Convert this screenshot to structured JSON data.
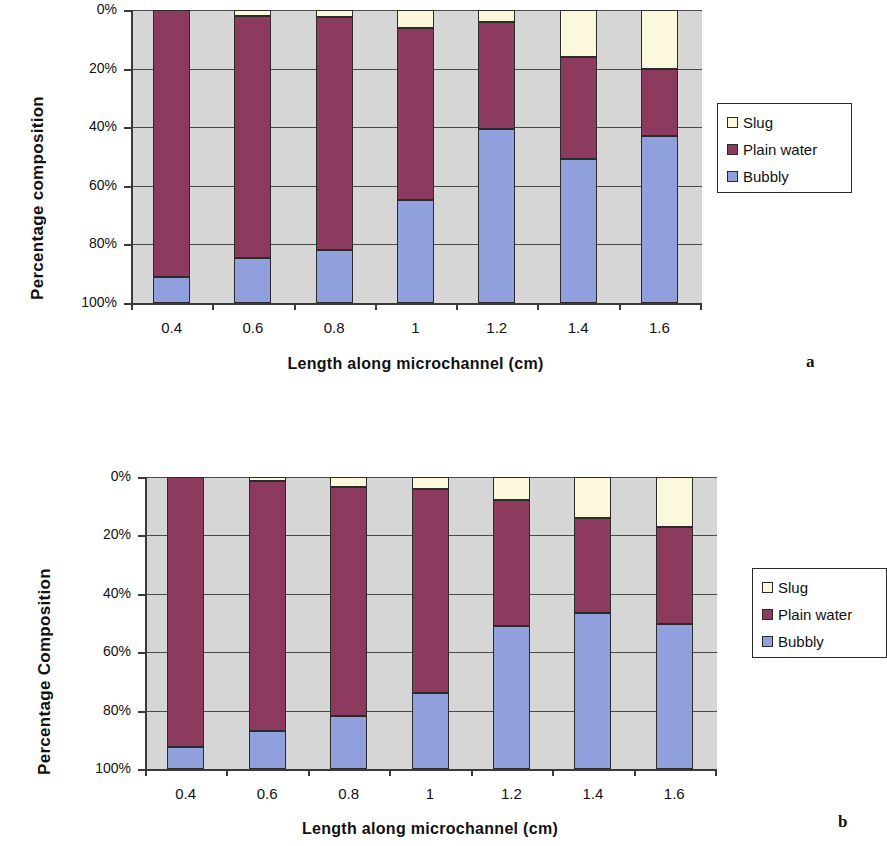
{
  "figure": {
    "background": "#ffffff",
    "series_colors": {
      "slug": "#fbf8dc",
      "plain_water": "#8c3a5e",
      "bubbly": "#8fa0dc",
      "plot_background": "#d6d6d6",
      "axis": "#3a3a3a"
    }
  },
  "charts": [
    {
      "panel": "a",
      "ylabel": "Percentage composition",
      "xlabel": "Length along microchannel (cm)",
      "ytick_labels": [
        "100%",
        "80%",
        "60%",
        "40%",
        "20%",
        "0%"
      ],
      "xtick_labels": [
        "0.4",
        "0.6",
        "0.8",
        "1",
        "1.2",
        "1.4",
        "1.6"
      ],
      "legend": [
        {
          "label": "Slug",
          "color": "#fbf8dc"
        },
        {
          "label": "Plain water",
          "color": "#8c3a5e"
        },
        {
          "label": "Bubbly",
          "color": "#8fa0dc"
        }
      ]
    },
    {
      "panel": "b",
      "ylabel": "Percentage Composition",
      "xlabel": "Length along microchannel (cm)",
      "ytick_labels": [
        "100%",
        "80%",
        "60%",
        "40%",
        "20%",
        "0%"
      ],
      "xtick_labels": [
        "0.4",
        "0.6",
        "0.8",
        "1",
        "1.2",
        "1.4",
        "1.6"
      ],
      "legend": [
        {
          "label": "Slug",
          "color": "#fbf8dc"
        },
        {
          "label": "Plain water",
          "color": "#8c3a5e"
        },
        {
          "label": "Bubbly",
          "color": "#8fa0dc"
        }
      ]
    }
  ],
  "chart_data": [
    {
      "type": "bar",
      "stacked": true,
      "panel": "a",
      "title": "",
      "xlabel": "Length along microchannel (cm)",
      "ylabel": "Percentage composition",
      "categories": [
        "0.4",
        "0.6",
        "0.8",
        "1",
        "1.2",
        "1.4",
        "1.6"
      ],
      "ylim": [
        0,
        100
      ],
      "ytick_values": [
        0,
        20,
        40,
        60,
        80,
        100
      ],
      "grid": true,
      "legend_position": "right",
      "series": [
        {
          "name": "Bubbly",
          "color": "#8fa0dc",
          "values": [
            9,
            15.5,
            18,
            35,
            59.5,
            49,
            57
          ]
        },
        {
          "name": "Plain water",
          "color": "#8c3a5e",
          "values": [
            91,
            82.5,
            79.5,
            59,
            36.5,
            35,
            23
          ]
        },
        {
          "name": "Slug",
          "color": "#fbf8dc",
          "values": [
            0,
            2,
            2.5,
            6,
            4,
            16,
            20
          ]
        }
      ]
    },
    {
      "type": "bar",
      "stacked": true,
      "panel": "b",
      "title": "",
      "xlabel": "Length along microchannel (cm)",
      "ylabel": "Percentage Composition",
      "categories": [
        "0.4",
        "0.6",
        "0.8",
        "1",
        "1.2",
        "1.4",
        "1.6"
      ],
      "ylim": [
        0,
        100
      ],
      "ytick_values": [
        0,
        20,
        40,
        60,
        80,
        100
      ],
      "grid": true,
      "legend_position": "right",
      "series": [
        {
          "name": "Bubbly",
          "color": "#8fa0dc",
          "values": [
            7.5,
            13,
            18,
            26,
            49,
            53.5,
            49.5
          ]
        },
        {
          "name": "Plain water",
          "color": "#8c3a5e",
          "values": [
            92.5,
            85.5,
            78.5,
            70,
            43,
            32.5,
            33.5
          ]
        },
        {
          "name": "Slug",
          "color": "#fbf8dc",
          "values": [
            0,
            1.5,
            3.5,
            4,
            8,
            14,
            17
          ]
        }
      ]
    }
  ],
  "panel_labels": {
    "a": "a",
    "b": "b"
  }
}
